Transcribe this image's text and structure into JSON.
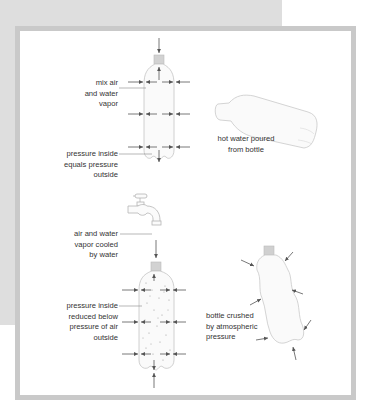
{
  "diagram": {
    "labels": {
      "mix_air": "mix air\nand water\nvapor",
      "pressure_equal": "pressure inside\nequals pressure\noutside",
      "hot_water": "hot water poured\nfrom bottle",
      "cooled": "air and water\nvapor cooled\nby water",
      "pressure_reduced": "pressure inside\nreduced below\npressure of air\noutside",
      "crushed": "bottle crushed\nby atmospheric\npressure"
    },
    "colors": {
      "background_panel": "#dedede",
      "frame_border": "#c9c9c9",
      "frame_fill": "#ffffff",
      "arrow": "#555555",
      "bottle_outline": "#bdbdbd",
      "cap": "#cfcfcf",
      "text": "#333333"
    }
  }
}
